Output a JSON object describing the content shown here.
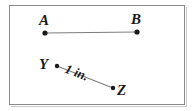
{
  "figure": {
    "type": "geometry-diagram",
    "background_color": "#ffffff",
    "border_color": "#8a8a8a",
    "line_color": "#7d7d7d",
    "dot_color": "#1a1a1a",
    "text_color": "#1a1a1a"
  },
  "segments": [
    {
      "id": "AB",
      "start_label": "A",
      "end_label": "B",
      "start_point": {
        "x": 45,
        "y": 33
      },
      "end_point": {
        "x": 137,
        "y": 32
      },
      "measure_label": ""
    },
    {
      "id": "YZ",
      "start_label": "Y",
      "end_label": "Z",
      "start_point": {
        "x": 57,
        "y": 66
      },
      "end_point": {
        "x": 113,
        "y": 88
      },
      "measure_label": "1 in."
    }
  ],
  "labels": {
    "a": "A",
    "b": "B",
    "y": "Y",
    "z": "Z",
    "yz_measure": "1 in."
  }
}
